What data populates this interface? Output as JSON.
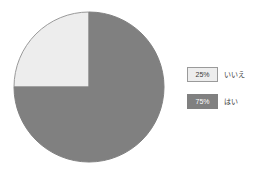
{
  "chart_data": {
    "type": "pie",
    "title": "",
    "subtitle": "",
    "xlabel": "",
    "ylabel": "",
    "grid": false,
    "legend_position": "right",
    "start_angle_deg": 90,
    "direction": "counterclockwise",
    "categories": [
      "いいえ",
      "はい"
    ],
    "values": [
      25,
      75
    ],
    "value_labels": [
      "25%",
      "75%"
    ],
    "colors": [
      "#ededed",
      "#808080"
    ],
    "slices": [
      {
        "label": "いいえ",
        "value": 25,
        "value_label": "25%",
        "color": "#ededed",
        "border_color": "#9a9a9a",
        "text_color": "#3a3a3a"
      },
      {
        "label": "はい",
        "value": 75,
        "value_label": "75%",
        "color": "#808080",
        "border_color": "#808080",
        "text_color": "#ffffff"
      }
    ]
  },
  "legend": {
    "items": [
      {
        "value_label": "25%",
        "label": "いいえ"
      },
      {
        "value_label": "75%",
        "label": "はい"
      }
    ]
  },
  "geometry": {
    "center_x": 76,
    "center_y": 76,
    "radius": 75
  }
}
